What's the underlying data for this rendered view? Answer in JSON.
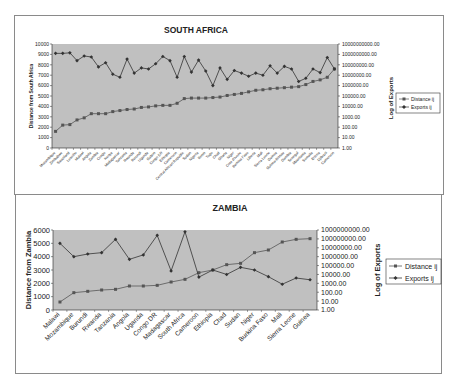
{
  "charts": {
    "south_africa": {
      "title": "SOUTH AFRICA",
      "ylabel_left": "Distance from South Africa",
      "ylabel_right": "Log of Exports",
      "legend": [
        "Distance ij",
        "Exports ij"
      ],
      "left_ticks": [
        "0",
        "1000",
        "2000",
        "3000",
        "4000",
        "5000",
        "6000",
        "7000",
        "8000",
        "9000",
        "10000"
      ],
      "right_ticks": [
        "1.00",
        "10.00",
        "100.00",
        "1000.00",
        "10000.00",
        "100000.00",
        "1000000.00",
        "10000000.00",
        "100000000.00",
        "1000000000.00",
        "10000000000.00"
      ]
    },
    "zambia": {
      "title": "ZAMBIA",
      "ylabel_left": "Distance from Zambia",
      "ylabel_right": "Log of Exports",
      "legend": [
        "Distance ij",
        "Exports ij"
      ],
      "left_ticks": [
        "0",
        "1000",
        "2000",
        "3000",
        "4000",
        "5000",
        "6000"
      ],
      "right_ticks": [
        "1.00",
        "10.00",
        "100.00",
        "1000.00",
        "10000.00",
        "100000.00",
        "1000000.00",
        "10000000.00",
        "100000000.00",
        "1000000000.00"
      ]
    }
  },
  "chart_data": [
    {
      "type": "line",
      "title": "SOUTH AFRICA",
      "xlabel": "",
      "ylabel": "Distance from South Africa",
      "ylabel_secondary": "Log of Exports",
      "ylim": [
        0,
        10000
      ],
      "ylim_secondary": [
        1,
        10000000000
      ],
      "secondary_scale": "log",
      "legend_position": "right",
      "grid": false,
      "categories": [
        "Mozambique",
        "Zimbabwe",
        "Swaziland",
        "Lesotho",
        "Malawi",
        "Angola",
        "Zambia",
        "Congo",
        "Kenya",
        "Madagascar",
        "Tanzania",
        "Rwanda",
        "Burundi",
        "Uganda",
        "Gabon",
        "Congo DR",
        "Ethiopia",
        "Cameroon",
        "Central African Republic",
        "Sudan",
        "Nigeria",
        "Benin",
        "Togo",
        "Chad",
        "Ghana",
        "Niger",
        "Cote d'Ivoire",
        "Burkina Faso",
        "Liberia",
        "Mali",
        "Sierra Leone",
        "Guinea",
        "Guinea-Bissau",
        "Gambia",
        "Senegal",
        "Mauritania",
        "Somalia",
        "Eritrea",
        "Djibouti",
        "Cameroon"
      ],
      "series": [
        {
          "name": "Distance ij",
          "axis": "left",
          "values": [
            1600,
            2200,
            2250,
            2700,
            2900,
            3300,
            3300,
            3300,
            3500,
            3600,
            3700,
            3750,
            3900,
            3950,
            4050,
            4100,
            4100,
            4300,
            4750,
            4800,
            4800,
            4800,
            4850,
            4900,
            5050,
            5150,
            5250,
            5400,
            5550,
            5600,
            5700,
            5750,
            5800,
            5850,
            5900,
            6100,
            6400,
            6550,
            6800,
            7600
          ]
        },
        {
          "name": "Exports ij",
          "axis": "right",
          "log10_values": [
            9.1,
            9.1,
            9.15,
            8.4,
            8.85,
            8.75,
            7.8,
            8.2,
            7.1,
            6.8,
            8.55,
            7.2,
            7.7,
            7.6,
            8.1,
            8.8,
            8.4,
            6.8,
            8.8,
            7.3,
            8.45,
            7.4,
            6.0,
            7.7,
            6.6,
            7.45,
            7.2,
            6.9,
            7.2,
            7.0,
            7.9,
            7.2,
            7.85,
            7.6,
            6.4,
            6.7,
            7.6,
            7.25,
            8.7,
            7.6
          ]
        }
      ]
    },
    {
      "type": "line",
      "title": "ZAMBIA",
      "xlabel": "",
      "ylabel": "Distance from Zambia",
      "ylabel_secondary": "Log of Exports",
      "ylim": [
        0,
        6000
      ],
      "ylim_secondary": [
        1,
        1000000000
      ],
      "secondary_scale": "log",
      "legend_position": "right",
      "grid": false,
      "categories": [
        "Malawi",
        "Mozambique",
        "Burundi",
        "Rwanda",
        "Tanzania",
        "Angola",
        "Uganda",
        "Congo DR",
        "Madagascar",
        "South Africa",
        "Cameroon",
        "Ethiopia",
        "Chad",
        "Sudan",
        "Niger",
        "Burkina Faso",
        "Mali",
        "Sierra Leone",
        "Guinea"
      ],
      "series": [
        {
          "name": "Distance ij",
          "axis": "left",
          "values": [
            600,
            1300,
            1400,
            1500,
            1550,
            1800,
            1800,
            1850,
            2100,
            2300,
            2800,
            3000,
            3400,
            3500,
            4300,
            4500,
            5100,
            5300,
            5350
          ]
        },
        {
          "name": "Exports ij",
          "axis": "right",
          "log10_values": [
            7.5,
            6.0,
            6.3,
            6.45,
            7.95,
            5.7,
            6.2,
            8.4,
            4.4,
            8.8,
            3.7,
            4.5,
            4.0,
            4.8,
            4.5,
            3.75,
            2.9,
            3.6,
            3.4
          ]
        }
      ]
    }
  ]
}
